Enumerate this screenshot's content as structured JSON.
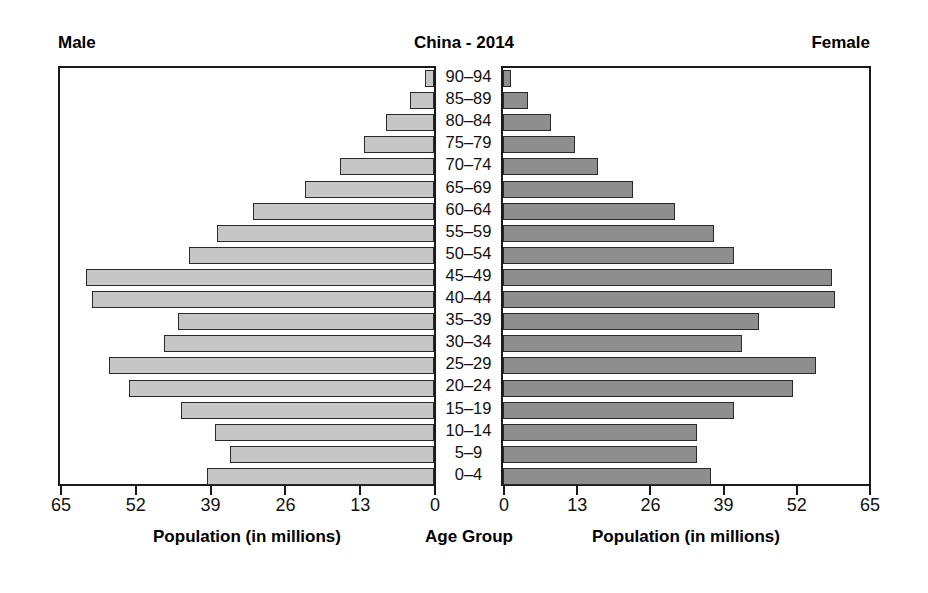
{
  "header": {
    "male_label": "Male",
    "title": "China - 2014",
    "female_label": "Female"
  },
  "axis_titles": {
    "left": "Population (in millions)",
    "center": "Age Group",
    "right": "Population (in millions)"
  },
  "chart_data": {
    "type": "bar",
    "subtype": "population-pyramid",
    "title": "China - 2014",
    "xlabel": "Population (in millions)",
    "ylabel": "Age Group",
    "grid": false,
    "legend_position": "none",
    "left_panel_label": "Male",
    "right_panel_label": "Female",
    "left_axis_direction": "reversed",
    "left_ticks": [
      65,
      52,
      39,
      26,
      13,
      0
    ],
    "right_ticks": [
      0,
      13,
      26,
      39,
      52,
      65
    ],
    "xlim": [
      0,
      65
    ],
    "categories": [
      "90–94",
      "85–89",
      "80–84",
      "75–79",
      "70–74",
      "65–69",
      "60–64",
      "55–59",
      "50–54",
      "45–49",
      "40–44",
      "35–39",
      "30–34",
      "25–29",
      "20–24",
      "15–19",
      "10–14",
      "5–9",
      "0–4"
    ],
    "series": [
      {
        "name": "Male",
        "color": "#c6c6c6",
        "values": [
          1.6,
          4.2,
          8.3,
          12.2,
          16.3,
          22.5,
          31.5,
          37.8,
          42.5,
          60.5,
          59.5,
          44.5,
          47.0,
          56.5,
          53.0,
          44.0,
          38.0,
          35.5,
          39.5
        ]
      },
      {
        "name": "Female",
        "color": "#8e8e8e",
        "values": [
          1.5,
          4.5,
          8.5,
          12.8,
          16.8,
          23.0,
          30.5,
          37.5,
          41.0,
          58.5,
          59.0,
          45.5,
          42.5,
          55.5,
          51.5,
          41.0,
          34.5,
          34.5,
          37.0
        ]
      }
    ]
  }
}
